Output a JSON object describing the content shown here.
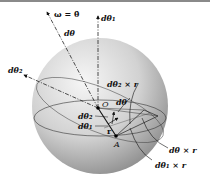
{
  "figure": {
    "labels": {
      "omega": "ω = θ̇",
      "omega_dot": "·",
      "d_theta": "dθ",
      "d_theta_1_top": "dθ₁",
      "d_theta_2_left": "dθ₂",
      "origin": "O",
      "d_theta_inner": "dθ",
      "d_theta2_cross_r": "dθ₂ × r",
      "d_theta_2_inner": "dθ₂",
      "d_theta_1_inner": "dθ₁",
      "r": "r",
      "point_a": "A",
      "d_theta_cross_r": "dθ × r",
      "d_theta1_cross_r": "dθ₁ × r"
    },
    "colors": {
      "sphere_light": "#f4f4f4",
      "sphere_dark": "#8f8f8f",
      "ink": "#111111",
      "topbar": "#8a8a8a"
    }
  }
}
